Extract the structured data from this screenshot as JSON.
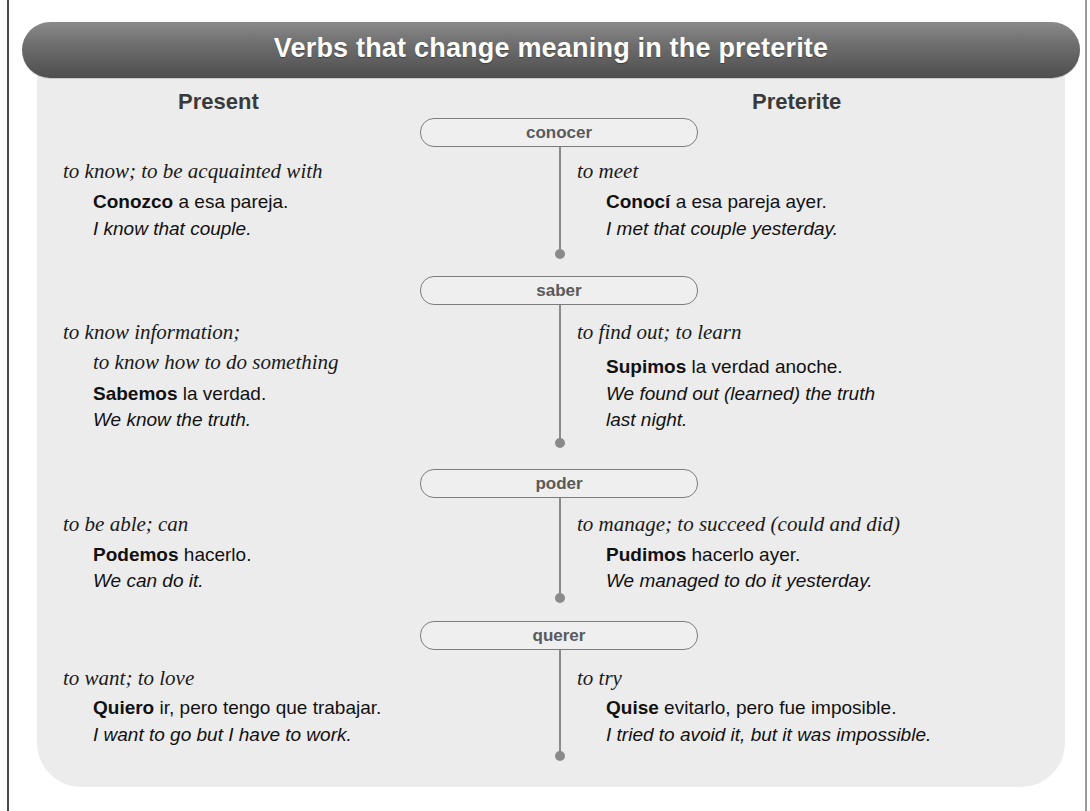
{
  "header": {
    "title": "Verbs that change meaning in the preterite",
    "gradient_top": "#8a8a8a",
    "gradient_bottom": "#4e4e4e"
  },
  "columns": {
    "present": "Present",
    "preterite": "Preterite"
  },
  "verbs": [
    {
      "infinitive": "conocer",
      "present": {
        "meaning": "to know; to be acquainted with",
        "meaning_line2": "",
        "example_verb": "Conozco",
        "example_rest": " a esa pareja.",
        "translation": "I know that couple.",
        "translation_line2": ""
      },
      "preterite": {
        "meaning": "to meet",
        "example_verb": "Conocí",
        "example_rest": " a esa pareja ayer.",
        "translation": "I met that couple yesterday.",
        "translation_line2": ""
      }
    },
    {
      "infinitive": "saber",
      "present": {
        "meaning": "to know information;",
        "meaning_line2": "to know how to do something",
        "example_verb": "Sabemos",
        "example_rest": " la verdad.",
        "translation": "We know the truth.",
        "translation_line2": ""
      },
      "preterite": {
        "meaning": "to find out; to learn",
        "example_verb": "Supimos",
        "example_rest": " la verdad anoche.",
        "translation": "We found out (learned) the truth",
        "translation_line2": "last night."
      }
    },
    {
      "infinitive": "poder",
      "present": {
        "meaning": "to be able; can",
        "meaning_line2": "",
        "example_verb": "Podemos",
        "example_rest": " hacerlo.",
        "translation": "We can do it.",
        "translation_line2": ""
      },
      "preterite": {
        "meaning": "to manage; to succeed (could and did)",
        "example_verb": "Pudimos",
        "example_rest": " hacerlo ayer.",
        "translation": "We managed to do it yesterday.",
        "translation_line2": ""
      }
    },
    {
      "infinitive": "querer",
      "present": {
        "meaning": "to want; to love",
        "meaning_line2": "",
        "example_verb": "Quiero",
        "example_rest": " ir, pero tengo que trabajar.",
        "translation": "I want to go but I have to work.",
        "translation_line2": ""
      },
      "preterite": {
        "meaning": "to try",
        "example_verb": "Quise",
        "example_rest": " evitarlo, pero fue imposible.",
        "translation": "I tried to avoid it, but it was impossible.",
        "translation_line2": ""
      }
    }
  ]
}
